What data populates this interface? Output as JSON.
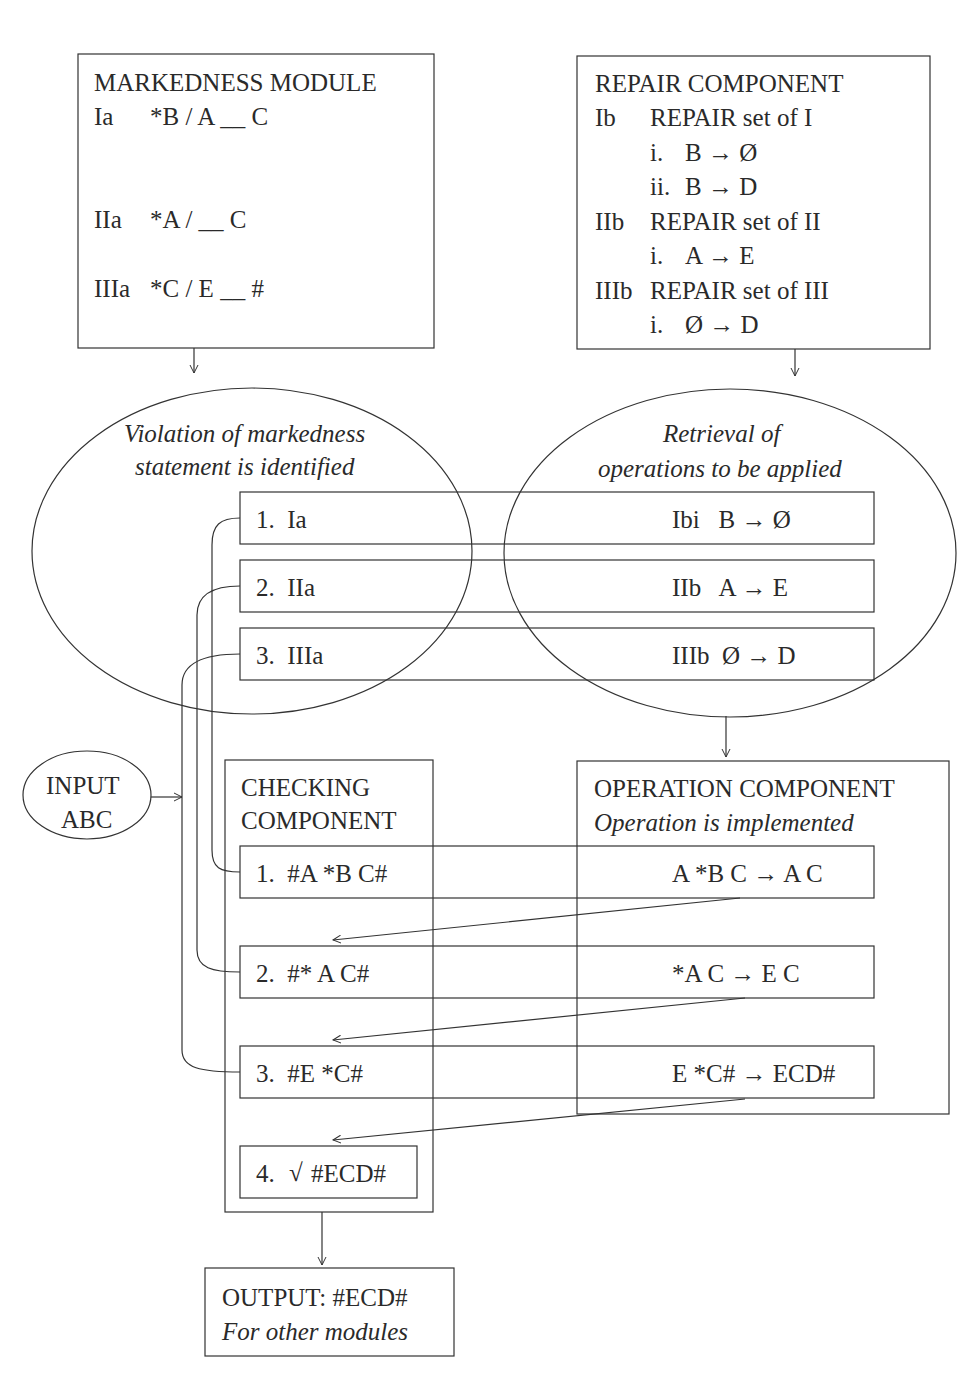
{
  "markedness_module": {
    "title": "MARKEDNESS MODULE",
    "rules": [
      {
        "id": "Ia",
        "rule": "*B / A __ C"
      },
      {
        "id": "IIa",
        "rule": "*A / __ C"
      },
      {
        "id": "IIIa",
        "rule": "*C / E __ #"
      }
    ]
  },
  "repair_component": {
    "title": "REPAIR COMPONENT",
    "sets": [
      {
        "id": "Ib",
        "label": "REPAIR set of I",
        "ops": [
          {
            "n": "i.",
            "op": "B → Ø"
          },
          {
            "n": "ii.",
            "op": "B → D"
          }
        ]
      },
      {
        "id": "IIb",
        "label": "REPAIR set of II",
        "ops": [
          {
            "n": "i.",
            "op": "A → E"
          }
        ]
      },
      {
        "id": "IIIb",
        "label": "REPAIR set of III",
        "ops": [
          {
            "n": "i.",
            "op": "Ø → D"
          }
        ]
      }
    ]
  },
  "violation_ellipse": {
    "line1": "Violation of markedness",
    "line2": "statement is identified"
  },
  "retrieval_ellipse": {
    "line1": "Retrieval of",
    "line2": "operations to be applied"
  },
  "violation_rows": [
    {
      "left": "1.  Ia",
      "right": "Ibi   B → Ø"
    },
    {
      "left": "2.  IIa",
      "right": "IIb   A → E"
    },
    {
      "left": "3.  IIIa",
      "right": "IIIb  Ø → D"
    }
  ],
  "input": {
    "line1": "INPUT",
    "line2": "ABC"
  },
  "checking_component": {
    "line1": "CHECKING",
    "line2": "COMPONENT",
    "rows": [
      "1.  #A *B C#",
      "2.  #* A C#",
      "3.  #E *C#"
    ],
    "final": {
      "num": "4.",
      "check": "√",
      "value": "#ECD#"
    }
  },
  "operation_component": {
    "title": "OPERATION COMPONENT",
    "subtitle": "Operation is implemented",
    "ops": [
      "A *B C → A C",
      "*A C → E C",
      "E *C# → ECD#"
    ]
  },
  "output": {
    "line1": "OUTPUT: #ECD#",
    "line2": "For other modules"
  }
}
